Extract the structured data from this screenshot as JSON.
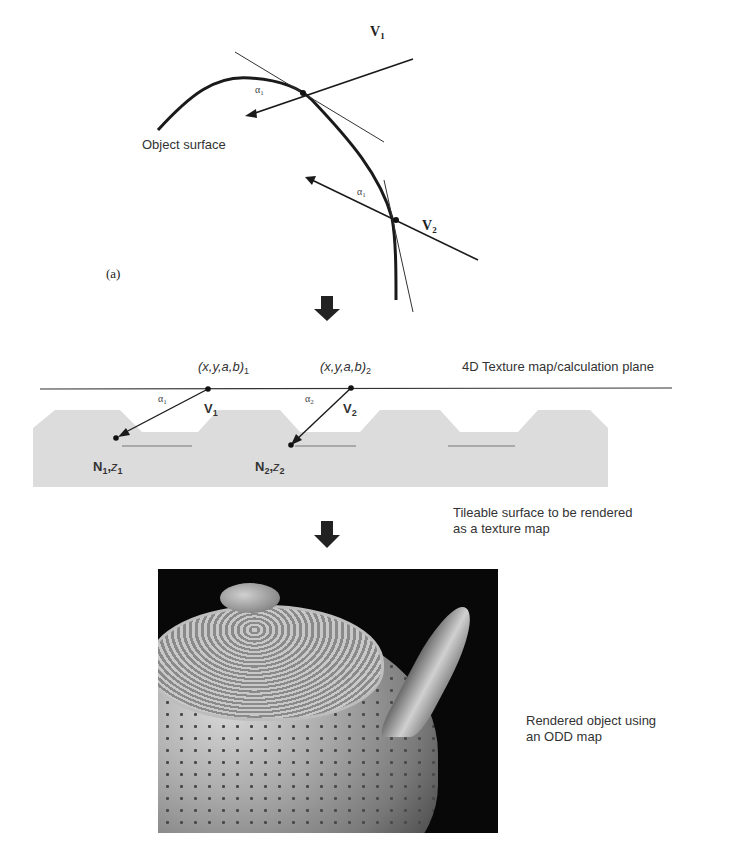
{
  "figure": {
    "panel_a": {
      "panel_label": "(a)",
      "surface_label": "Object surface",
      "vectors": [
        {
          "label": "V",
          "index": "1",
          "angle_label": "α",
          "angle_index": "1"
        },
        {
          "label": "V",
          "index": "2",
          "angle_label": "α",
          "angle_index": "1"
        }
      ]
    },
    "panel_b": {
      "plane_label": "4D Texture map/calculation plane",
      "points": [
        {
          "coord": "(x,y,a,b)",
          "coord_index": "1",
          "vector_label": "V",
          "vector_index": "1",
          "angle_label": "α",
          "angle_index": "1",
          "normal_label": "N",
          "normal_index": "1",
          "depth_label": "z",
          "depth_index": "1"
        },
        {
          "coord": "(x,y,a,b)",
          "coord_index": "2",
          "vector_label": "V",
          "vector_index": "2",
          "angle_label": "α",
          "angle_index": "2",
          "normal_label": "N",
          "normal_index": "2",
          "depth_label": "z",
          "depth_index": "2"
        }
      ],
      "surface_caption_line1": "Tileable surface to be rendered",
      "surface_caption_line2": "as a texture map"
    },
    "panel_c": {
      "caption_line1": "Rendered object using",
      "caption_line2": "an ODD map"
    },
    "colors": {
      "line": "#1a1a1a",
      "surface_fill": "#dcdcdc",
      "arrow_fill": "#222222",
      "render_background": "#080808"
    }
  }
}
